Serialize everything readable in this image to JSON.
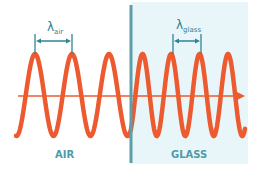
{
  "diagram": {
    "regions": [
      {
        "name": "air",
        "label": "AIR"
      },
      {
        "name": "glass",
        "label": "GLASS"
      }
    ],
    "wavelength_labels": {
      "air": {
        "symbol": "λ",
        "subscript": "air"
      },
      "glass": {
        "symbol": "λ",
        "subscript": "glass"
      }
    },
    "wave": {
      "air_cycles_shown": 3,
      "glass_cycles_shown": 4,
      "wavelength_ratio_glass_to_air": 0.77
    },
    "colors": {
      "wave": "#ee5a2f",
      "axis": "#ee5a2f",
      "glass_fill": "#e8f6fa",
      "divider": "#5d9ea9",
      "bracket": "#2f8595",
      "region_label": "#6aa5b2"
    }
  }
}
